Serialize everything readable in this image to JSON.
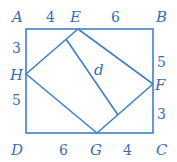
{
  "diagram": {
    "points": {
      "A": "A",
      "B": "B",
      "C": "C",
      "D": "D",
      "E": "E",
      "F": "F",
      "G": "G",
      "H": "H"
    },
    "segment_label": "d",
    "lengths": {
      "AE": "4",
      "EB": "6",
      "AH": "3",
      "HD": "5",
      "BF": "5",
      "FC": "3",
      "DG": "6",
      "GC": "4"
    },
    "color": "#3f80c8"
  }
}
